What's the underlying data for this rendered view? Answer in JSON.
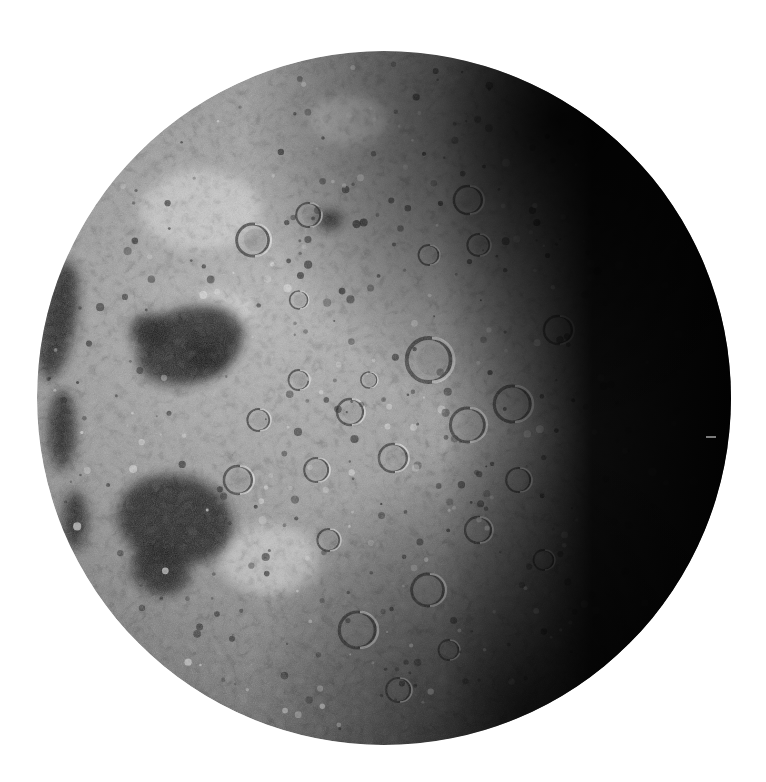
{
  "image": {
    "subject": "Moon",
    "background_color": "#ffffff",
    "width": 766,
    "height": 782
  },
  "moon": {
    "center_x": 384,
    "center_y": 398,
    "radius": 347,
    "lit_color_light": "#c9c9c9",
    "lit_color_mid": "#8e8e8e",
    "shadow_color": "#050505",
    "terminator_side": "right",
    "maria": [
      {
        "cx": 190,
        "cy": 345,
        "rx": 55,
        "ry": 38,
        "rot": -20
      },
      {
        "cx": 150,
        "cy": 330,
        "rx": 20,
        "ry": 16,
        "rot": 0
      },
      {
        "cx": 205,
        "cy": 355,
        "rx": 22,
        "ry": 18,
        "rot": 0
      },
      {
        "cx": 175,
        "cy": 520,
        "rx": 58,
        "ry": 45,
        "rot": 10
      },
      {
        "cx": 160,
        "cy": 570,
        "rx": 30,
        "ry": 24,
        "rot": 20
      },
      {
        "cx": 58,
        "cy": 320,
        "rx": 18,
        "ry": 60,
        "rot": 10
      },
      {
        "cx": 62,
        "cy": 430,
        "rx": 14,
        "ry": 40,
        "rot": 0
      },
      {
        "cx": 75,
        "cy": 520,
        "rx": 12,
        "ry": 30,
        "rot": 0
      },
      {
        "cx": 330,
        "cy": 220,
        "rx": 12,
        "ry": 10,
        "rot": 0
      }
    ],
    "highlands_bright": [
      {
        "cx": 200,
        "cy": 210,
        "rx": 60,
        "ry": 40
      },
      {
        "cx": 220,
        "cy": 310,
        "rx": 35,
        "ry": 20
      },
      {
        "cx": 350,
        "cy": 120,
        "rx": 40,
        "ry": 25
      },
      {
        "cx": 270,
        "cy": 560,
        "rx": 50,
        "ry": 35
      }
    ],
    "craters": [
      {
        "cx": 432,
        "cy": 360,
        "r": 22
      },
      {
        "cx": 470,
        "cy": 425,
        "r": 17
      },
      {
        "cx": 395,
        "cy": 458,
        "r": 14
      },
      {
        "cx": 352,
        "cy": 412,
        "r": 13
      },
      {
        "cx": 370,
        "cy": 380,
        "r": 8
      },
      {
        "cx": 300,
        "cy": 380,
        "r": 10
      },
      {
        "cx": 318,
        "cy": 470,
        "r": 12
      },
      {
        "cx": 515,
        "cy": 404,
        "r": 18
      },
      {
        "cx": 520,
        "cy": 480,
        "r": 12
      },
      {
        "cx": 470,
        "cy": 200,
        "r": 14
      },
      {
        "cx": 480,
        "cy": 245,
        "r": 11
      },
      {
        "cx": 430,
        "cy": 255,
        "r": 10
      },
      {
        "cx": 430,
        "cy": 590,
        "r": 16
      },
      {
        "cx": 360,
        "cy": 630,
        "r": 18
      },
      {
        "cx": 400,
        "cy": 690,
        "r": 12
      },
      {
        "cx": 260,
        "cy": 420,
        "r": 11
      },
      {
        "cx": 255,
        "cy": 240,
        "r": 16
      },
      {
        "cx": 310,
        "cy": 215,
        "r": 12
      },
      {
        "cx": 480,
        "cy": 530,
        "r": 13
      },
      {
        "cx": 300,
        "cy": 300,
        "r": 9
      },
      {
        "cx": 545,
        "cy": 560,
        "r": 10
      },
      {
        "cx": 240,
        "cy": 480,
        "r": 14
      },
      {
        "cx": 330,
        "cy": 540,
        "r": 11
      },
      {
        "cx": 560,
        "cy": 330,
        "r": 14
      },
      {
        "cx": 450,
        "cy": 650,
        "r": 10
      }
    ]
  }
}
